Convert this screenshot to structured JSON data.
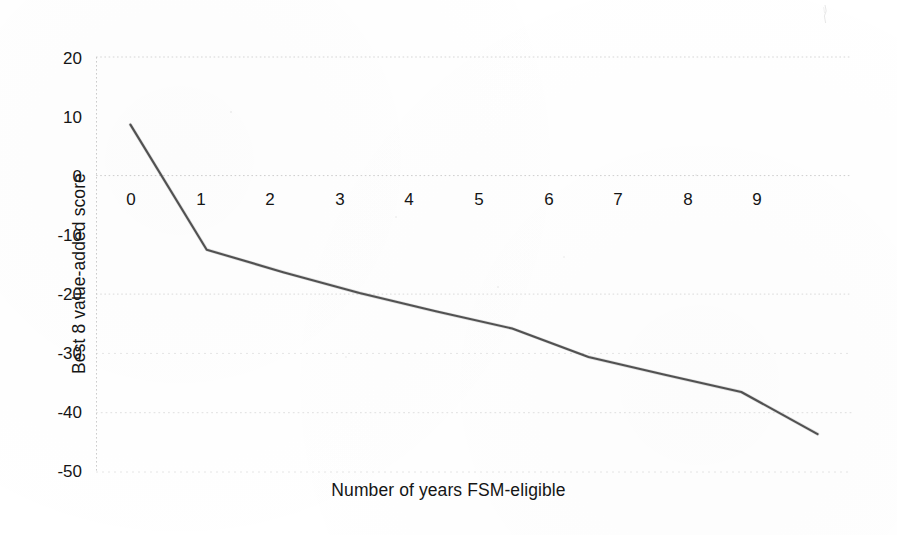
{
  "chart_data": {
    "type": "line",
    "title": "",
    "xlabel": "Number of years FSM-eligible",
    "ylabel": "Best 8 value-added score",
    "x": [
      0,
      1,
      2,
      3,
      4,
      5,
      6,
      7,
      8,
      9
    ],
    "values": [
      8.6,
      -12.5,
      -16.3,
      -19.8,
      -22.9,
      -25.8,
      -30.6,
      -33.6,
      -36.5,
      -43.6
    ],
    "series": [
      {
        "name": "Best 8 value-added score",
        "values": [
          8.6,
          -12.5,
          -16.3,
          -19.8,
          -22.9,
          -25.8,
          -30.6,
          -33.6,
          -36.5,
          -43.6
        ]
      }
    ],
    "xtick_labels": [
      "0",
      "1",
      "2",
      "3",
      "4",
      "5",
      "6",
      "7",
      "8",
      "9"
    ],
    "ytick_labels": [
      "20",
      "10",
      "0",
      "-10",
      "-20",
      "-30",
      "-40",
      "-50"
    ],
    "ytick_values": [
      20,
      10,
      0,
      -10,
      -20,
      -30,
      -40,
      -50
    ],
    "xlim": [
      -0.45,
      9.45
    ],
    "ylim": [
      -50,
      20
    ],
    "grid": "horizontal-dotted",
    "gridlines_at": [
      20,
      0,
      -20,
      -30,
      -40,
      -50
    ],
    "legend": "none",
    "line_color": "#4a4a4a",
    "gridline_color": "#d9d9d9",
    "background_color": "#ffffff",
    "annotations": []
  },
  "figure": {
    "y_axis_title": "Best 8 value-added score",
    "x_axis_title": "Number of years FSM-eligible"
  }
}
